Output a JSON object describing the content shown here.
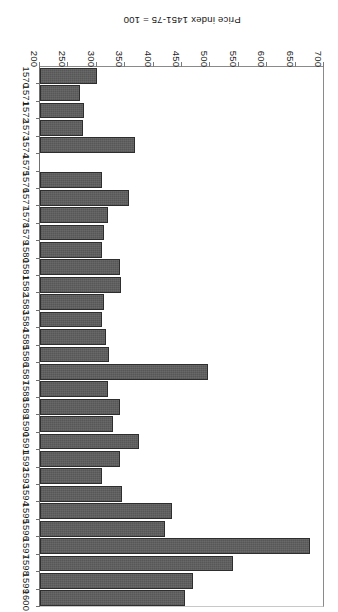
{
  "chart_data": {
    "type": "bar",
    "orientation": "horizontal",
    "title": "",
    "subtitle": "",
    "xlabel": "Price index 1451-75 = 100",
    "ylabel": "",
    "grid": false,
    "legend": null,
    "rotated_180": true,
    "baseline": 200,
    "xlim": [
      200,
      700
    ],
    "xticks": [
      700,
      650,
      600,
      550,
      500,
      450,
      400,
      350,
      300,
      250,
      200
    ],
    "xtick_labels": [
      "700",
      "650",
      "600",
      "550",
      "500",
      "450",
      "400",
      "350",
      "300",
      "250",
      "200"
    ],
    "categories": [
      "1570",
      "1571",
      "1572",
      "1573",
      "1574",
      "1575",
      "1576",
      "1577",
      "1578",
      "1579",
      "1580",
      "1581",
      "1582",
      "1583",
      "1584",
      "1585",
      "1586",
      "1587",
      "1588",
      "1589",
      "1590",
      "1591",
      "1592",
      "1593",
      "1594",
      "1595",
      "1596",
      "1597",
      "1598",
      "1599",
      "1600"
    ],
    "values": [
      300,
      270,
      277,
      275,
      368,
      200,
      310,
      357,
      320,
      312,
      310,
      340,
      343,
      313,
      309,
      316,
      322,
      495,
      320,
      340,
      328,
      375,
      340,
      310,
      345,
      432,
      420,
      675,
      540,
      470,
      455
    ],
    "missing_categories": [
      "1575"
    ],
    "series": [
      {
        "name": "Price index 1451-75 = 100",
        "color": "#575757",
        "values": [
          300,
          270,
          277,
          275,
          368,
          200,
          310,
          357,
          320,
          312,
          310,
          340,
          343,
          313,
          309,
          316,
          322,
          495,
          320,
          340,
          328,
          375,
          340,
          310,
          345,
          432,
          420,
          675,
          540,
          470,
          455
        ]
      }
    ]
  },
  "colors": {
    "bar_fill": "#575757",
    "bar_edge": "#2e2e2e",
    "axis": "#7a7a7a",
    "text": "#1a1a1a",
    "background": "#ffffff"
  }
}
